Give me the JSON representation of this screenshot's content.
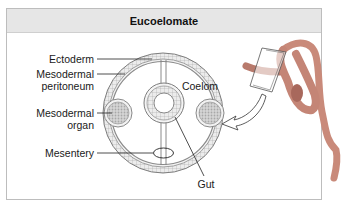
{
  "figure": {
    "title": "Eucoelomate"
  },
  "labels": {
    "ectoderm": "Ectoderm",
    "mesodermal_peritoneum_1": "Mesodermal",
    "mesodermal_peritoneum_2": "peritoneum",
    "mesodermal_organ_1": "Mesodermal",
    "mesodermal_organ_2": "organ",
    "mesentery": "Mesentery",
    "coelom": "Coelom",
    "gut": "Gut"
  },
  "colors": {
    "header_bg": "#e6e6e6",
    "frame_border": "#bdbdbd",
    "tissue_fill": "#e4e4e4",
    "tissue_stroke": "#8a8a8a",
    "worm_body": "#c98a7a",
    "worm_shadow": "#9d6256"
  }
}
